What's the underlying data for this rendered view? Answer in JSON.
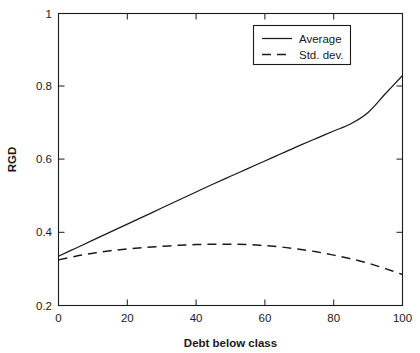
{
  "chart_data": {
    "type": "line",
    "title": "",
    "xlabel": "Debt below class",
    "ylabel": "RGD",
    "xlim": [
      0,
      100
    ],
    "ylim": [
      0.2,
      1
    ],
    "grid": false,
    "legend_position": "top-right",
    "xticks": [
      "0",
      "20",
      "40",
      "60",
      "80",
      "100"
    ],
    "xtick_values": [
      0,
      20,
      40,
      60,
      80,
      100
    ],
    "yticks": [
      "0.2",
      "0.4",
      "0.6",
      "0.8",
      "1"
    ],
    "ytick_values": [
      0.2,
      0.4,
      0.6,
      0.8,
      1
    ],
    "x": [
      0,
      5,
      10,
      15,
      20,
      25,
      30,
      35,
      40,
      45,
      50,
      55,
      60,
      65,
      70,
      75,
      80,
      85,
      90,
      95,
      100
    ],
    "series": [
      {
        "name": "Average",
        "style": "solid",
        "color": "#1a1a1a",
        "values": [
          0.335,
          0.357,
          0.379,
          0.401,
          0.423,
          0.445,
          0.467,
          0.489,
          0.511,
          0.533,
          0.554,
          0.575,
          0.596,
          0.617,
          0.638,
          0.658,
          0.678,
          0.698,
          0.729,
          0.78,
          0.83
        ]
      },
      {
        "name": "Std. dev.",
        "style": "dashed",
        "color": "#1a1a1a",
        "values": [
          0.325,
          0.335,
          0.343,
          0.35,
          0.355,
          0.359,
          0.362,
          0.365,
          0.367,
          0.368,
          0.368,
          0.367,
          0.364,
          0.36,
          0.354,
          0.347,
          0.338,
          0.328,
          0.316,
          0.301,
          0.285
        ]
      }
    ]
  },
  "legend": {
    "entries": [
      {
        "label": "Average"
      },
      {
        "label": "Std. dev."
      }
    ]
  },
  "axes": {
    "x_title": "Debt below class",
    "y_title": "RGD"
  }
}
